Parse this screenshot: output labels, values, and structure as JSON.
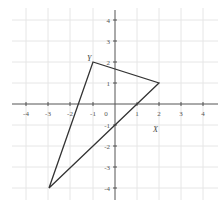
{
  "diagram": {
    "type": "coordinate-plane-triangle",
    "x_range": [
      -4,
      4
    ],
    "y_range": [
      -4,
      4
    ],
    "x_ticks": [
      "-4",
      "-3",
      "-2",
      "-1",
      "0",
      "1",
      "2",
      "3",
      "4"
    ],
    "y_ticks": [
      "4",
      "3",
      "2",
      "1",
      "-1",
      "-2",
      "-3",
      "-4"
    ],
    "vertices": [
      {
        "label": "Y",
        "x": -1,
        "y": 2
      },
      {
        "label": "",
        "x": 2,
        "y": 1
      },
      {
        "label": "",
        "x": -3,
        "y": -4
      }
    ],
    "axis_label": "X",
    "colors": {
      "grid": "#e4e4e4",
      "axis": "#555555",
      "triangle": "#333333"
    }
  }
}
